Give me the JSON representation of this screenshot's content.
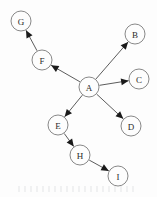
{
  "figure": {
    "width": 157,
    "height": 197,
    "background_color": "#fdfdfd"
  },
  "style": {
    "node_fill": "#fdfdfd",
    "node_stroke": "#7a7a7a",
    "node_radius": 10,
    "label_color": "#2b2b2b",
    "edge_color": "#4a4a4a",
    "arrow_color": "#1a1a1a"
  },
  "graph": {
    "type": "directed",
    "root": "A",
    "nodes": [
      {
        "id": "A",
        "label": "A",
        "cx": 89,
        "cy": 87,
        "r": 10
      },
      {
        "id": "B",
        "label": "B",
        "cx": 135,
        "cy": 34,
        "r": 10
      },
      {
        "id": "C",
        "label": "C",
        "cx": 139,
        "cy": 79,
        "r": 10
      },
      {
        "id": "D",
        "label": "D",
        "cx": 131,
        "cy": 126,
        "r": 10
      },
      {
        "id": "E",
        "label": "E",
        "cx": 58,
        "cy": 125,
        "r": 10
      },
      {
        "id": "F",
        "label": "F",
        "cx": 42,
        "cy": 60,
        "r": 10
      },
      {
        "id": "G",
        "label": "G",
        "cx": 21,
        "cy": 21,
        "r": 10
      },
      {
        "id": "H",
        "label": "H",
        "cx": 80,
        "cy": 155,
        "r": 10
      },
      {
        "id": "I",
        "label": "I",
        "cx": 118,
        "cy": 176,
        "r": 10
      }
    ],
    "edges": [
      {
        "from": "A",
        "to": "B",
        "directed": true
      },
      {
        "from": "A",
        "to": "C",
        "directed": true
      },
      {
        "from": "A",
        "to": "D",
        "directed": true
      },
      {
        "from": "A",
        "to": "E",
        "directed": true
      },
      {
        "from": "A",
        "to": "F",
        "directed": true
      },
      {
        "from": "F",
        "to": "G",
        "directed": true
      },
      {
        "from": "E",
        "to": "H",
        "directed": true
      },
      {
        "from": "H",
        "to": "I",
        "directed": true
      }
    ]
  }
}
